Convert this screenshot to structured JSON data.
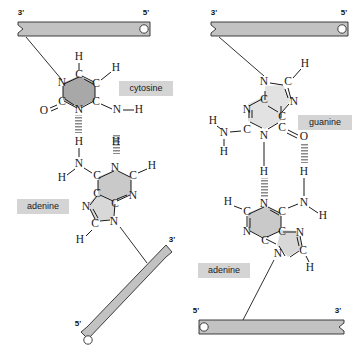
{
  "figure": {
    "panels": [
      {
        "id": "left",
        "name": "adenine-cytosine-pair",
        "bases": [
          "cytosine",
          "adenine"
        ],
        "labels": {
          "top_base": "cytosine",
          "bottom_base": "adenine"
        },
        "backbones": [
          {
            "name": "top-backbone",
            "left_end": "3'",
            "right_end": "5'",
            "orientation": "horizontal",
            "cap_left": "notch",
            "cap_right": "circle"
          },
          {
            "name": "bottom-backbone",
            "left_end": "5'",
            "right_end": "3'",
            "orientation": "diagonal",
            "cap_left": "circle",
            "cap_right": "notch"
          }
        ],
        "hydrogen_bonds": 2
      },
      {
        "id": "right",
        "name": "adenine-guanine-pair",
        "bases": [
          "guanine",
          "adenine"
        ],
        "labels": {
          "top_base": "guanine",
          "bottom_base": "adenine"
        },
        "backbones": [
          {
            "name": "top-backbone",
            "left_end": "3'",
            "right_end": "5'",
            "orientation": "horizontal",
            "cap_left": "notch",
            "cap_right": "circle"
          },
          {
            "name": "bottom-backbone",
            "left_end": "5'",
            "right_end": "3'",
            "orientation": "horizontal",
            "cap_left": "circle",
            "cap_right": "notch"
          }
        ],
        "hydrogen_bonds": 2
      }
    ]
  },
  "prime_labels": {
    "three": "3'",
    "five": "5'"
  },
  "base_labels": {
    "cytosine": "cytosine",
    "adenine_left": "adenine",
    "guanine": "guanine",
    "adenine_right": "adenine"
  },
  "atoms": {
    "C": "C",
    "N": "N",
    "O": "O",
    "H": "H"
  },
  "left_panel_atoms": {
    "cytosine": [
      "H",
      "C",
      "C",
      "H",
      "N",
      "C",
      "O",
      "N",
      "C",
      "N",
      "H",
      "H"
    ],
    "adenine": [
      "H",
      "H",
      "N",
      "H",
      "C",
      "N",
      "C",
      "H",
      "C",
      "N",
      "C",
      "N",
      "C",
      "N",
      "H"
    ]
  },
  "right_panel_atoms": {
    "guanine": [
      "H",
      "C",
      "N",
      "N",
      "C",
      "C",
      "C",
      "N",
      "H",
      "H",
      "N",
      "C",
      "O",
      "H"
    ],
    "adenine": [
      "H",
      "H",
      "N",
      "H",
      "C",
      "N",
      "C",
      "N",
      "C",
      "C",
      "N",
      "C",
      "H"
    ]
  },
  "colors": {
    "backbone_bar": "#c2c2c2",
    "ring_shade_dark": "#a8a8a8",
    "ring_shade_mid": "#c9c9c9",
    "ring_shade_light": "#d8d8d8",
    "ring_shade_pale": "#e2e2e2",
    "label_background": "#d4d4d4",
    "line": "#1a1a1a",
    "hydrogen_bond": "#7d7d7d",
    "page_background": "#ffffff"
  }
}
